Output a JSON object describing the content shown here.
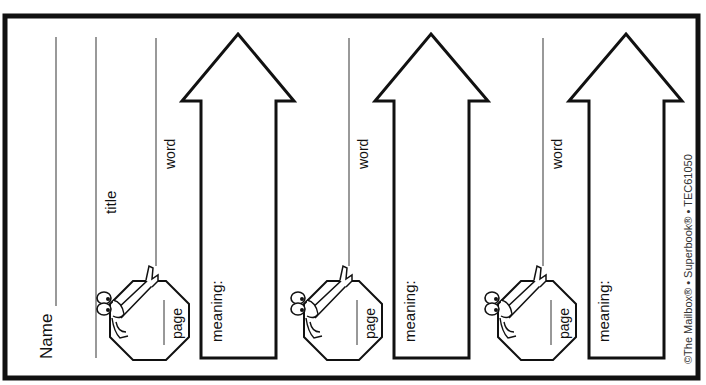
{
  "document": {
    "type": "vocabulary bookmark worksheet",
    "name_label": "Name",
    "title_label": "title",
    "copyright": "©The Mailbox® • Superbook® • TEC61050"
  },
  "bookmarks": [
    {
      "word_label": "word",
      "page_label": "page",
      "meaning_label": "meaning:"
    },
    {
      "word_label": "word",
      "page_label": "page",
      "meaning_label": "meaning:"
    },
    {
      "word_label": "word",
      "page_label": "page",
      "meaning_label": "meaning:"
    }
  ],
  "colors": {
    "ink": "#111111",
    "paper": "#ffffff",
    "rule": "#555555"
  }
}
